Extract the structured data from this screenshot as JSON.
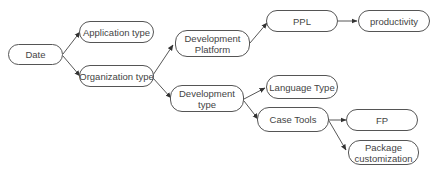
{
  "diagram": {
    "type": "tree",
    "nodes": {
      "date": {
        "label": "Date"
      },
      "application_type": {
        "label": "Application type"
      },
      "organization_type": {
        "label": "Organization type"
      },
      "development_platform": {
        "line1": "Development",
        "line2": "Platform"
      },
      "development_type": {
        "line1": "Development",
        "line2": "type"
      },
      "ppl": {
        "label": "PPL"
      },
      "productivity": {
        "label": "productivity"
      },
      "language_type": {
        "label": "Language Type"
      },
      "case_tools": {
        "label": "Case Tools"
      },
      "fp": {
        "label": "FP"
      },
      "package_customization": {
        "line1": "Package",
        "line2": "customization"
      }
    },
    "edges": [
      {
        "from": "Date",
        "to": "Application type"
      },
      {
        "from": "Date",
        "to": "Organization type"
      },
      {
        "from": "Organization type",
        "to": "Development Platform"
      },
      {
        "from": "Organization type",
        "to": "Development type"
      },
      {
        "from": "Development Platform",
        "to": "PPL"
      },
      {
        "from": "PPL",
        "to": "productivity"
      },
      {
        "from": "Development type",
        "to": "Language Type"
      },
      {
        "from": "Development type",
        "to": "Case Tools"
      },
      {
        "from": "Case Tools",
        "to": "FP"
      },
      {
        "from": "Case Tools",
        "to": "Package customization"
      }
    ],
    "colors": {
      "stroke": "#555555",
      "text": "#444444",
      "background": "#ffffff"
    }
  }
}
